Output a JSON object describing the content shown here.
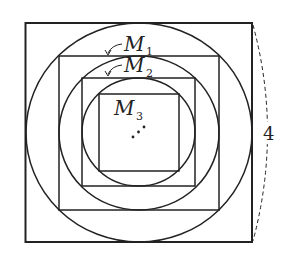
{
  "diagram": {
    "labels": {
      "m1": {
        "main": "M",
        "sub": "1"
      },
      "m2": {
        "main": "M",
        "sub": "2"
      },
      "m3": {
        "main": "M",
        "sub": "3"
      }
    },
    "side_length_label": "4",
    "ellipsis": "⋰",
    "colors": {
      "stroke": "#222222",
      "background": "#ffffff"
    }
  }
}
